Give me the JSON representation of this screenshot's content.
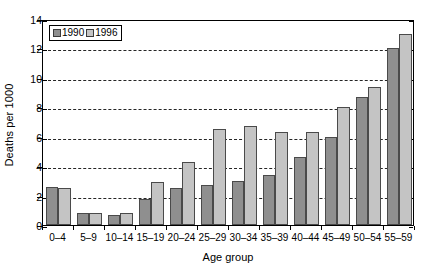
{
  "chart_data": {
    "type": "bar",
    "title": "",
    "xlabel": "Age group",
    "ylabel": "Deaths per 1000",
    "categories": [
      "0–4",
      "5–9",
      "10–14",
      "15–19",
      "20–24",
      "25–29",
      "30–34",
      "35–39",
      "40–44",
      "45–49",
      "50–54",
      "55–59"
    ],
    "series": [
      {
        "name": "1990",
        "color": "#8f8f8f",
        "values": [
          2.6,
          0.8,
          0.7,
          1.8,
          2.5,
          2.7,
          3.0,
          3.4,
          4.6,
          6.0,
          8.7,
          12.0
        ]
      },
      {
        "name": "1996",
        "color": "#c4c4c4",
        "values": [
          2.5,
          0.8,
          0.8,
          2.9,
          4.3,
          6.5,
          6.7,
          6.3,
          6.3,
          8.0,
          9.4,
          13.0
        ]
      }
    ],
    "ylim": [
      0,
      14
    ],
    "yticks": [
      0,
      2,
      4,
      6,
      8,
      10,
      12,
      14
    ],
    "ytick_labels": [
      "0",
      "2",
      "4",
      "6",
      "8",
      "10",
      "12",
      "14"
    ],
    "grid": true,
    "grid_axis": "y",
    "grid_style": "dashed",
    "legend_position": "upper left",
    "legend_entries": [
      "1990",
      "1996"
    ]
  }
}
